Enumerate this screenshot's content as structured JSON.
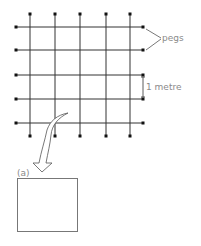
{
  "diagram": {
    "grid": {
      "columns_x": [
        30,
        55,
        80,
        106,
        130
      ],
      "rows_y": [
        27,
        50,
        75,
        99,
        123
      ],
      "top_peg_y": 14,
      "bottom_peg_y": 136,
      "left_peg_x": 16,
      "right_peg_x": 143,
      "line_color": "#333333"
    },
    "labels": {
      "pegs": "pegs",
      "spacing": "1 metre",
      "inset": "(a)"
    },
    "inset_box": {
      "x": 17,
      "y": 178,
      "width": 60,
      "height": 53
    }
  }
}
